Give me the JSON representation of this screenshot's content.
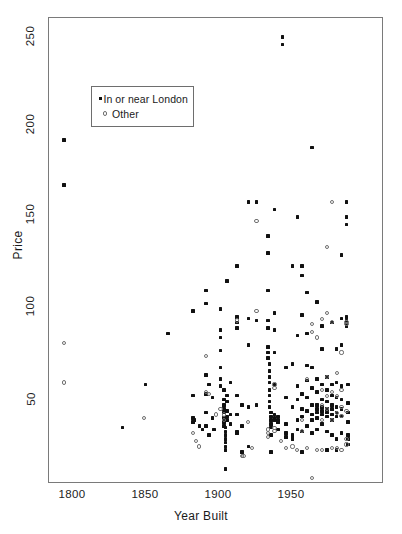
{
  "chart_data": {
    "type": "scatter",
    "title": "",
    "xlabel": "Year Built",
    "ylabel": "Price",
    "xlim": [
      1788,
      1993
    ],
    "ylim": [
      10,
      258
    ],
    "xticks": [
      1800,
      1850,
      1900,
      1950
    ],
    "xtick_labels": [
      "1800",
      "1850",
      "1900",
      "1950"
    ],
    "yticks": [
      50,
      100,
      150,
      200,
      250
    ],
    "ytick_labels": [
      "50",
      "100",
      "150",
      "200",
      "250"
    ],
    "grid": false,
    "legend_position": "upper-left-inside",
    "series": [
      {
        "name": "In or near London",
        "marker": "filled-square",
        "color": "#111111",
        "points": [
          [
            1797,
            193
          ],
          [
            1797,
            169
          ],
          [
            1833,
            40
          ],
          [
            1847,
            63
          ],
          [
            1861,
            90
          ],
          [
            1876,
            102
          ],
          [
            1876,
            57
          ],
          [
            1876,
            45
          ],
          [
            1876,
            43
          ],
          [
            1877,
            44
          ],
          [
            1880,
            41
          ],
          [
            1882,
            39
          ],
          [
            1884,
            113
          ],
          [
            1884,
            106
          ],
          [
            1884,
            68
          ],
          [
            1884,
            58
          ],
          [
            1884,
            48
          ],
          [
            1884,
            41
          ],
          [
            1886,
            63
          ],
          [
            1886,
            36
          ],
          [
            1888,
            56
          ],
          [
            1888,
            45
          ],
          [
            1889,
            39
          ],
          [
            1893,
            103
          ],
          [
            1893,
            92
          ],
          [
            1893,
            88
          ],
          [
            1893,
            81
          ],
          [
            1893,
            72
          ],
          [
            1893,
            66
          ],
          [
            1893,
            62
          ],
          [
            1895,
            60
          ],
          [
            1895,
            55
          ],
          [
            1895,
            52
          ],
          [
            1895,
            50
          ],
          [
            1895,
            48
          ],
          [
            1895,
            45
          ],
          [
            1895,
            43
          ],
          [
            1895,
            41
          ],
          [
            1896,
            40
          ],
          [
            1896,
            38
          ],
          [
            1896,
            36
          ],
          [
            1896,
            34
          ],
          [
            1896,
            32
          ],
          [
            1896,
            30
          ],
          [
            1896,
            28
          ],
          [
            1896,
            18
          ],
          [
            1897,
            118
          ],
          [
            1897,
            57
          ],
          [
            1897,
            54
          ],
          [
            1897,
            49
          ],
          [
            1897,
            46
          ],
          [
            1897,
            44
          ],
          [
            1899,
            64
          ],
          [
            1899,
            47
          ],
          [
            1899,
            42
          ],
          [
            1903,
            126
          ],
          [
            1903,
            99
          ],
          [
            1903,
            96
          ],
          [
            1903,
            93
          ],
          [
            1903,
            57
          ],
          [
            1903,
            47
          ],
          [
            1903,
            38
          ],
          [
            1903,
            37
          ],
          [
            1906,
            52
          ],
          [
            1906,
            41
          ],
          [
            1906,
            27
          ],
          [
            1910,
            160
          ],
          [
            1910,
            98
          ],
          [
            1910,
            84
          ],
          [
            1910,
            51
          ],
          [
            1910,
            30
          ],
          [
            1915,
            160
          ],
          [
            1915,
            97
          ],
          [
            1915,
            52
          ],
          [
            1922,
            142
          ],
          [
            1922,
            133
          ],
          [
            1922,
            113
          ],
          [
            1922,
            97
          ],
          [
            1922,
            93
          ],
          [
            1922,
            83
          ],
          [
            1922,
            80
          ],
          [
            1922,
            77
          ],
          [
            1923,
            74
          ],
          [
            1923,
            70
          ],
          [
            1923,
            67
          ],
          [
            1923,
            64
          ],
          [
            1923,
            60
          ],
          [
            1923,
            57
          ],
          [
            1923,
            54
          ],
          [
            1923,
            51
          ],
          [
            1924,
            48
          ],
          [
            1924,
            46
          ],
          [
            1924,
            44
          ],
          [
            1924,
            42
          ],
          [
            1924,
            40
          ],
          [
            1924,
            36
          ],
          [
            1924,
            27
          ],
          [
            1926,
            156
          ],
          [
            1926,
            101
          ],
          [
            1926,
            92
          ],
          [
            1926,
            80
          ],
          [
            1926,
            63
          ],
          [
            1926,
            47
          ],
          [
            1926,
            45
          ],
          [
            1926,
            44
          ],
          [
            1928,
            46
          ],
          [
            1928,
            44
          ],
          [
            1928,
            43
          ],
          [
            1928,
            39
          ],
          [
            1931,
            248
          ],
          [
            1931,
            244
          ],
          [
            1933,
            72
          ],
          [
            1933,
            56
          ],
          [
            1933,
            42
          ],
          [
            1933,
            37
          ],
          [
            1933,
            35
          ],
          [
            1937,
            126
          ],
          [
            1937,
            74
          ],
          [
            1937,
            51
          ],
          [
            1937,
            36
          ],
          [
            1937,
            35
          ],
          [
            1937,
            34
          ],
          [
            1940,
            152
          ],
          [
            1940,
            89
          ],
          [
            1940,
            62
          ],
          [
            1940,
            55
          ],
          [
            1940,
            44
          ],
          [
            1940,
            39
          ],
          [
            1943,
            126
          ],
          [
            1943,
            121
          ],
          [
            1943,
            100
          ],
          [
            1943,
            58
          ],
          [
            1943,
            50
          ],
          [
            1943,
            46
          ],
          [
            1943,
            38
          ],
          [
            1943,
            27
          ],
          [
            1946,
            112
          ],
          [
            1946,
            90
          ],
          [
            1946,
            73
          ],
          [
            1946,
            65
          ],
          [
            1946,
            56
          ],
          [
            1946,
            49
          ],
          [
            1946,
            41
          ],
          [
            1949,
            189
          ],
          [
            1949,
            72
          ],
          [
            1949,
            61
          ],
          [
            1949,
            52
          ],
          [
            1949,
            47
          ],
          [
            1949,
            44
          ],
          [
            1949,
            37
          ],
          [
            1952,
            107
          ],
          [
            1952,
            66
          ],
          [
            1952,
            59
          ],
          [
            1952,
            52
          ],
          [
            1952,
            50
          ],
          [
            1952,
            48
          ],
          [
            1952,
            45
          ],
          [
            1952,
            39
          ],
          [
            1955,
            94
          ],
          [
            1955,
            82
          ],
          [
            1955,
            63
          ],
          [
            1955,
            55
          ],
          [
            1955,
            51
          ],
          [
            1955,
            49
          ],
          [
            1955,
            47
          ],
          [
            1955,
            42
          ],
          [
            1958,
            67
          ],
          [
            1958,
            60
          ],
          [
            1958,
            54
          ],
          [
            1958,
            50
          ],
          [
            1958,
            48
          ],
          [
            1958,
            46
          ],
          [
            1958,
            38
          ],
          [
            1958,
            28
          ],
          [
            1961,
            96
          ],
          [
            1961,
            63
          ],
          [
            1961,
            57
          ],
          [
            1961,
            52
          ],
          [
            1961,
            50
          ],
          [
            1961,
            47
          ],
          [
            1961,
            44
          ],
          [
            1961,
            36
          ],
          [
            1964,
            82
          ],
          [
            1964,
            64
          ],
          [
            1964,
            56
          ],
          [
            1964,
            51
          ],
          [
            1964,
            48
          ],
          [
            1964,
            46
          ],
          [
            1964,
            34
          ],
          [
            1964,
            28
          ],
          [
            1967,
            132
          ],
          [
            1967,
            98
          ],
          [
            1967,
            84
          ],
          [
            1967,
            62
          ],
          [
            1967,
            55
          ],
          [
            1967,
            50
          ],
          [
            1967,
            46
          ],
          [
            1967,
            37
          ],
          [
            1970,
            160
          ],
          [
            1970,
            152
          ],
          [
            1970,
            148
          ],
          [
            1970,
            99
          ],
          [
            1970,
            97
          ],
          [
            1970,
            96
          ],
          [
            1970,
            94
          ],
          [
            1971,
            63
          ],
          [
            1971,
            53
          ],
          [
            1971,
            48
          ],
          [
            1971,
            43
          ],
          [
            1971,
            36
          ],
          [
            1971,
            34
          ],
          [
            1971,
            31
          ]
        ]
      },
      {
        "name": "Other",
        "marker": "open-circle",
        "color": "#6e6e6e",
        "points": [
          [
            1797,
            85
          ],
          [
            1797,
            64
          ],
          [
            1846,
            45
          ],
          [
            1876,
            37
          ],
          [
            1878,
            33
          ],
          [
            1880,
            30
          ],
          [
            1884,
            78
          ],
          [
            1884,
            59
          ],
          [
            1886,
            58
          ],
          [
            1890,
            47
          ],
          [
            1893,
            50
          ],
          [
            1895,
            47
          ],
          [
            1895,
            44
          ],
          [
            1903,
            97
          ],
          [
            1906,
            25
          ],
          [
            1907,
            25
          ],
          [
            1910,
            43
          ],
          [
            1912,
            29
          ],
          [
            1915,
            102
          ],
          [
            1915,
            150
          ],
          [
            1922,
            39
          ],
          [
            1922,
            37
          ],
          [
            1922,
            35
          ],
          [
            1926,
            63
          ],
          [
            1926,
            61
          ],
          [
            1926,
            40
          ],
          [
            1926,
            38
          ],
          [
            1930,
            33
          ],
          [
            1933,
            29
          ],
          [
            1937,
            30
          ],
          [
            1940,
            28
          ],
          [
            1943,
            44
          ],
          [
            1943,
            38
          ],
          [
            1946,
            66
          ],
          [
            1946,
            29
          ],
          [
            1949,
            13
          ],
          [
            1949,
            95
          ],
          [
            1949,
            91
          ],
          [
            1952,
            88
          ],
          [
            1952,
            28
          ],
          [
            1955,
            98
          ],
          [
            1955,
            60
          ],
          [
            1955,
            52
          ],
          [
            1955,
            44
          ],
          [
            1955,
            28
          ],
          [
            1958,
            136
          ],
          [
            1958,
            101
          ],
          [
            1958,
            67
          ],
          [
            1958,
            57
          ],
          [
            1958,
            50
          ],
          [
            1961,
            160
          ],
          [
            1961,
            96
          ],
          [
            1961,
            59
          ],
          [
            1961,
            44
          ],
          [
            1961,
            29
          ],
          [
            1964,
            69
          ],
          [
            1964,
            57
          ],
          [
            1964,
            48
          ],
          [
            1964,
            29
          ],
          [
            1967,
            80
          ],
          [
            1967,
            60
          ],
          [
            1967,
            51
          ],
          [
            1967,
            46
          ],
          [
            1967,
            28
          ],
          [
            1970,
            96
          ],
          [
            1970,
            95
          ],
          [
            1970,
            49
          ],
          [
            1970,
            34
          ],
          [
            1970,
            31
          ]
        ]
      }
    ]
  },
  "axes": {
    "ylabel": "Price",
    "xlabel": "Year Built"
  },
  "legend": {
    "entries": [
      {
        "label": "In or near London",
        "marker": "filled-square"
      },
      {
        "label": "Other",
        "marker": "open-circle"
      }
    ]
  }
}
